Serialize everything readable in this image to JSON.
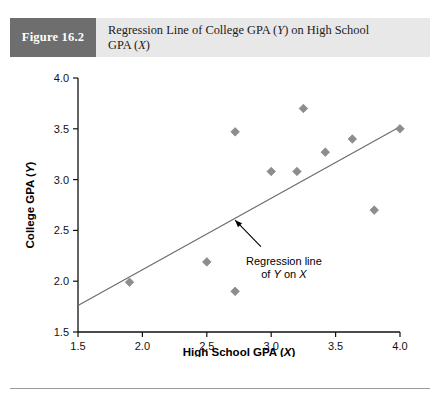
{
  "figure": {
    "number_label": "Figure 16.2",
    "title_line1_pre": "Regression Line of College GPA (",
    "title_line1_ital": "Y",
    "title_line1_post": ") on High School",
    "title_line2_pre": "GPA (",
    "title_line2_ital": "X",
    "title_line2_post": ")",
    "title_full": "Regression Line of College GPA (Y) on High School GPA (X)",
    "header_box_color": "#6e6e6e",
    "header_band_color": "#e8e8e8"
  },
  "chart_data": {
    "type": "scatter",
    "xlabel_pre": "High School GPA (",
    "xlabel_ital": "X",
    "xlabel_post": ")",
    "xlabel": "High School GPA (X)",
    "ylabel_pre": "College GPA (",
    "ylabel_ital": "Y",
    "ylabel_post": ")",
    "ylabel": "College GPA (Y)",
    "xlim": [
      1.5,
      4.0
    ],
    "ylim": [
      1.5,
      4.0
    ],
    "xticks": [
      "1.5",
      "2.0",
      "2.5",
      "3.0",
      "3.5",
      "4.0"
    ],
    "xtick_values": [
      1.5,
      2.0,
      2.5,
      3.0,
      3.5,
      4.0
    ],
    "yticks": [
      "1.5",
      "2.0",
      "2.5",
      "3.0",
      "3.5",
      "4.0"
    ],
    "ytick_values": [
      1.5,
      2.0,
      2.5,
      3.0,
      3.5,
      4.0
    ],
    "grid": false,
    "legend": null,
    "marker_shape": "diamond",
    "marker_color": "#8d8d8d",
    "line_color": "#6a6a6a",
    "points": [
      {
        "x": 1.9,
        "y": 1.99
      },
      {
        "x": 2.5,
        "y": 2.19
      },
      {
        "x": 2.72,
        "y": 1.9
      },
      {
        "x": 2.72,
        "y": 3.47
      },
      {
        "x": 3.0,
        "y": 3.08
      },
      {
        "x": 3.2,
        "y": 3.08
      },
      {
        "x": 3.25,
        "y": 3.7
      },
      {
        "x": 3.42,
        "y": 3.27
      },
      {
        "x": 3.63,
        "y": 3.4
      },
      {
        "x": 3.8,
        "y": 2.7
      },
      {
        "x": 4.0,
        "y": 3.5
      }
    ],
    "regression_line": {
      "x_start": 1.5,
      "y_start": 1.76,
      "x_end": 4.0,
      "y_end": 3.52
    },
    "annotation": {
      "line1": "Regression line",
      "line2_pre": "of ",
      "line2_ital1": "Y",
      "line2_mid": " on ",
      "line2_ital2": "X",
      "text_full": "Regression line of Y on X",
      "arrow_tip": {
        "x": 2.72,
        "y": 2.6
      },
      "arrow_tail": {
        "x": 2.92,
        "y": 2.34
      }
    }
  }
}
